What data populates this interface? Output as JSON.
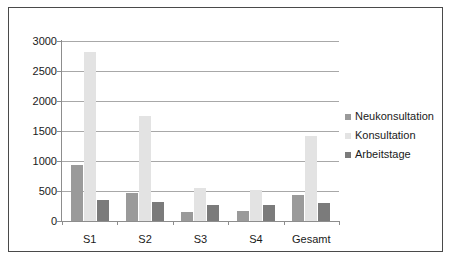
{
  "chart_data": {
    "type": "bar",
    "title": "",
    "subtitle": "",
    "xlabel": "",
    "ylabel": "",
    "categories": [
      "S1",
      "S2",
      "S3",
      "S4",
      "Gesamt"
    ],
    "series": [
      {
        "name": "Neukonsultation",
        "color": "#9a9a9a",
        "values": [
          930,
          475,
          150,
          160,
          435
        ]
      },
      {
        "name": "Konsultation",
        "color": "#e3e3e3",
        "values": [
          2810,
          1755,
          550,
          515,
          1420
        ]
      },
      {
        "name": "Arbeitstage",
        "color": "#7b7b7b",
        "values": [
          345,
          320,
          265,
          260,
          300
        ]
      }
    ],
    "ylim": [
      0,
      3000
    ],
    "ytick_step": 500,
    "yticks": [
      0,
      500,
      1000,
      1500,
      2000,
      2500,
      3000
    ],
    "ytick_labels": [
      "0",
      "500",
      "1000",
      "1500",
      "2000",
      "2500",
      "3000"
    ],
    "grid": true,
    "grid_axis": "y",
    "legend_position": "right",
    "frame": true
  }
}
